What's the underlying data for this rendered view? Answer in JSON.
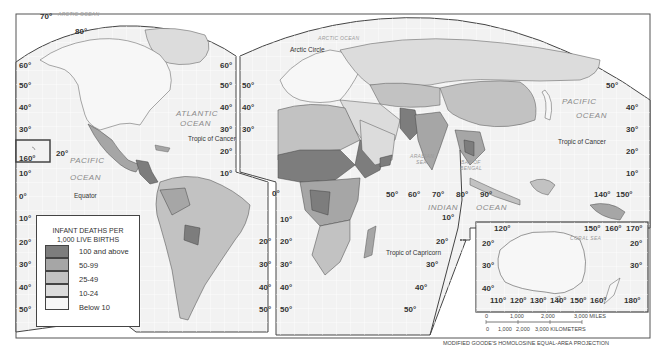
{
  "map": {
    "title": "Infant Deaths per 1,000 Live Births",
    "projection": "MODIFIED GOODE'S HOMOLOSINE EQUAL-AREA PROJECTION",
    "colors": {
      "background": "#ffffff",
      "ocean": "#f3f3f3",
      "grid": "#ffffff",
      "border": "#444444",
      "class_100_above": "#7d7d7d",
      "class_50_99": "#a6a6a6",
      "class_25_49": "#c2c2c2",
      "class_10_24": "#dcdcdc",
      "class_below_10": "#f7f7f7"
    },
    "ocean_labels": {
      "arctic_left": "ARCTIC OCEAN",
      "arctic_right": "ARCTIC OCEAN",
      "atlantic_1": "ATLANTIC",
      "atlantic_2": "OCEAN",
      "pacific_left_1": "PACIFIC",
      "pacific_left_2": "OCEAN",
      "pacific_right_1": "PACIFIC",
      "pacific_right_2": "OCEAN",
      "indian_1": "INDIAN",
      "indian_2": "OCEAN",
      "arabian_1": "ARABIAN",
      "arabian_2": "SEA",
      "bengal_1": "BAY OF",
      "bengal_2": "BENGAL",
      "coral": "CORAL SEA"
    },
    "line_labels": {
      "arctic_circle": "Arctic Circle",
      "tropic_cancer_left": "Tropic of Cancer",
      "tropic_cancer_right": "Tropic of Cancer",
      "tropic_capricorn": "Tropic of Capricorn",
      "equator": "Equator"
    },
    "latitude_labels": {
      "left_edge": [
        "60°",
        "50°",
        "40°",
        "30°",
        "20°",
        "10°",
        "0°",
        "10°",
        "20°",
        "30°",
        "40°",
        "50°"
      ],
      "americas_right": [
        "60°",
        "50°",
        "40°",
        "30°",
        "20°",
        "10°"
      ],
      "eurasia_left": [
        "50°",
        "40°",
        "30°"
      ],
      "south_america_right": [
        "20°",
        "30°",
        "40°",
        "50°"
      ],
      "africa_left": [
        "10°",
        "20°",
        "30°",
        "40°",
        "50°"
      ],
      "indian_ocean_edge": [
        "10°",
        "20°",
        "30°",
        "40°",
        "50°"
      ],
      "pacific_right": [
        "50°",
        "40°",
        "30°",
        "20°",
        "10°"
      ],
      "top_arc": [
        "70°",
        "80°"
      ],
      "hawaii_inset": "160°",
      "hawaii_lat": "20°",
      "prime_meridian": "0°"
    },
    "longitude_labels": {
      "indian": [
        "50°",
        "60°",
        "70°",
        "80°",
        "90°"
      ],
      "pacific": [
        "140°",
        "150°"
      ]
    },
    "australia_inset": {
      "top": [
        "120°",
        "150°",
        "160°",
        "170°"
      ],
      "left": [
        "20°",
        "30°",
        "40°"
      ],
      "right": [
        "20°",
        "30°"
      ],
      "bottom": [
        "110°",
        "120°",
        "130°",
        "140°",
        "150°",
        "160°",
        "180°"
      ]
    },
    "scale": {
      "miles": [
        "0",
        "1,000",
        "2,000",
        "3,000 MILES"
      ],
      "km": [
        "0",
        "1,000",
        "2,000",
        "3,000 KILOMETERS"
      ]
    }
  },
  "legend": {
    "title_1": "INFANT DEATHS PER",
    "title_2": "1,000 LIVE BIRTHS",
    "items": [
      {
        "label": "100 and above",
        "color": "#7d7d7d"
      },
      {
        "label": "50-99",
        "color": "#a6a6a6"
      },
      {
        "label": "25-49",
        "color": "#c2c2c2"
      },
      {
        "label": "10-24",
        "color": "#dcdcdc"
      },
      {
        "label": "Below 10",
        "color": "#f7f7f7"
      }
    ]
  }
}
